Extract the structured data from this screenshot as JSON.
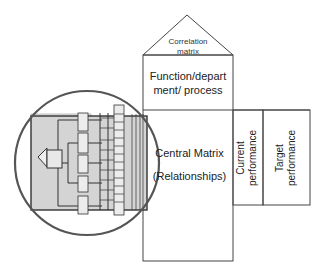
{
  "diagram": {
    "roof": {
      "label": "Correlation matrix"
    },
    "top_room": {
      "label_line1": "Function/depart",
      "label_line2": "ment/ process"
    },
    "central": {
      "label_line1": "Central Matrix",
      "label_line2": "(Relationships)"
    },
    "right_rooms": [
      {
        "label_line1": "Current",
        "label_line2": "performance"
      },
      {
        "label_line1": "Target",
        "label_line2": "performance"
      }
    ],
    "highlight": {
      "shape": "circle",
      "note": "left-hand requirements tree zoomed"
    },
    "colors": {
      "line": "#333333",
      "fill_grey": "#d4d4d4",
      "box_fill": "#ececec",
      "circle": "#555555"
    }
  }
}
